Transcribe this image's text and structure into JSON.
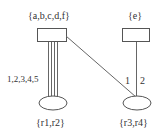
{
  "diagram": {
    "nodes": [
      {
        "id": "top-left",
        "shape": "rectangle",
        "label": "{a,b,c,d,f}"
      },
      {
        "id": "top-right",
        "shape": "rectangle",
        "label": "{e}"
      },
      {
        "id": "bottom-left",
        "shape": "ellipse",
        "label": "{r1,r2}"
      },
      {
        "id": "bottom-right",
        "shape": "ellipse",
        "label": "{r3,r4}"
      }
    ],
    "edges": [
      {
        "from": "top-left",
        "to": "bottom-left",
        "count": 4,
        "label": "1,2,3,4,5"
      },
      {
        "from": "top-left",
        "to": "bottom-right",
        "label": "1"
      },
      {
        "from": "top-right",
        "to": "bottom-right",
        "label": "2"
      }
    ]
  },
  "labels": {
    "top_left": "{a,b,c,d,f}",
    "top_right": "{e}",
    "bottom_left": "{r1,r2}",
    "bottom_right": "{r3,r4}",
    "edge_left": "1,2,3,4,5",
    "edge_diag": "1",
    "edge_right": "2"
  },
  "colors": {
    "stroke": "#555555",
    "text": "#333333",
    "background": "#ffffff"
  }
}
